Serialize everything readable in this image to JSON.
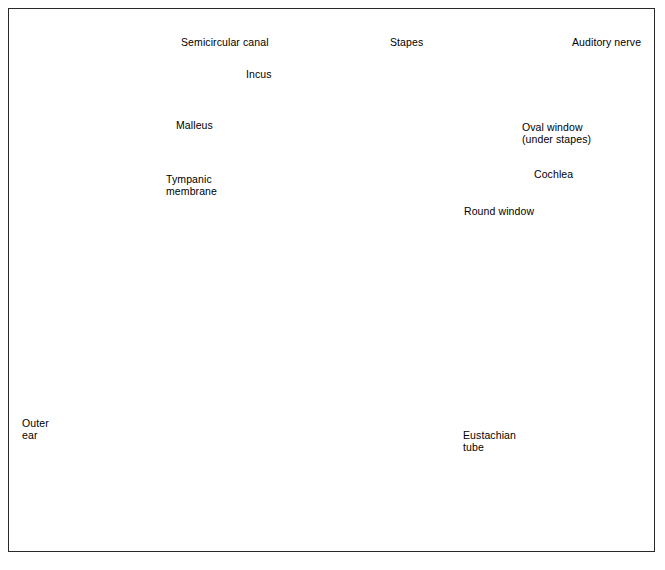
{
  "figure": {
    "background_color": "#ffffff",
    "border_color": "#2a2a2a",
    "style": "grayscale medical illustration",
    "panels": [
      {
        "name": "inner-ear-detail",
        "description": "Enlarged view of middle and inner ear: ossicles, semicircular canals, cochlea and auditory nerve"
      },
      {
        "name": "whole-ear-cross-section",
        "description": "Cross section of the complete ear from pinna through ear canal to cochlea and eustachian tube"
      }
    ]
  },
  "labels": {
    "semicircular_canal": "Semicircular canal",
    "incus": "Incus",
    "malleus": "Malleus",
    "tympanic_membrane_line1": "Tympanic",
    "tympanic_membrane_line2": "membrane",
    "stapes": "Stapes",
    "auditory_nerve": "Auditory nerve",
    "oval_window_line1": "Oval window",
    "oval_window_line2": "(under stapes)",
    "cochlea": "Cochlea",
    "round_window": "Round window",
    "outer_ear_line1": "Outer",
    "outer_ear_line2": "ear",
    "eustachian_tube_line1": "Eustachian",
    "eustachian_tube_line2": "tube"
  },
  "colors": {
    "ink": "#000000",
    "border": "#2a2a2a",
    "bone_light": "#e9e7e2",
    "bone_speckle": "#b9b6ae",
    "tissue_mid": "#8d8d8d",
    "tissue_dark": "#4a4a4a",
    "tissue_darkest": "#2b2b2b",
    "canal_pale": "#f4f3f1",
    "highlight": "#ffffff"
  }
}
